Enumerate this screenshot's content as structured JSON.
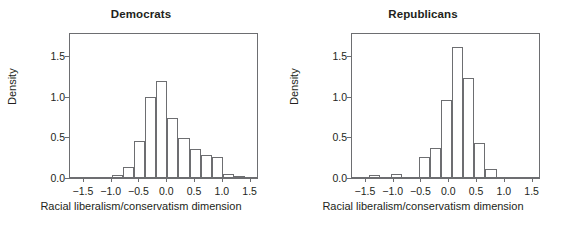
{
  "figure": {
    "background": "#ffffff",
    "line_color": "#6d6e71",
    "text_color": "#231f20"
  },
  "chart_data": [
    {
      "type": "bar",
      "title": "Democrats",
      "xlabel": "Racial liberalism/conservatism dimension",
      "ylabel": "Density",
      "xlim": [
        -1.75,
        1.65
      ],
      "ylim": [
        0,
        1.78
      ],
      "grid": false,
      "legend": null,
      "xticks": [
        -1.5,
        -1.0,
        -0.5,
        0.0,
        0.5,
        1.0,
        1.5
      ],
      "xticklabels": [
        "−1.5",
        "−1.0",
        "−0.5",
        "0.0",
        "0.5",
        "1.0",
        "1.5"
      ],
      "yticks": [
        0.0,
        0.5,
        1.0,
        1.5
      ],
      "yticklabels": [
        "0.0",
        "0.5",
        "1.0",
        "1.5"
      ],
      "bins": [
        {
          "x0": -1.0,
          "x1": -0.8,
          "value": 0.02
        },
        {
          "x0": -0.8,
          "x1": -0.6,
          "value": 0.12
        },
        {
          "x0": -0.6,
          "x1": -0.4,
          "value": 0.44
        },
        {
          "x0": -0.4,
          "x1": -0.2,
          "value": 0.98
        },
        {
          "x0": -0.2,
          "x1": 0.0,
          "value": 1.18
        },
        {
          "x0": 0.0,
          "x1": 0.2,
          "value": 0.73
        },
        {
          "x0": 0.2,
          "x1": 0.4,
          "value": 0.48
        },
        {
          "x0": 0.4,
          "x1": 0.6,
          "value": 0.34
        },
        {
          "x0": 0.6,
          "x1": 0.8,
          "value": 0.27
        },
        {
          "x0": 0.8,
          "x1": 1.0,
          "value": 0.24
        },
        {
          "x0": 1.0,
          "x1": 1.2,
          "value": 0.04
        },
        {
          "x0": 1.2,
          "x1": 1.4,
          "value": 0.015
        }
      ]
    },
    {
      "type": "bar",
      "title": "Republicans",
      "xlabel": "Racial liberalism/conservatism dimension",
      "ylabel": "Density",
      "xlim": [
        -1.75,
        1.65
      ],
      "ylim": [
        0,
        1.78
      ],
      "grid": false,
      "legend": null,
      "xticks": [
        -1.5,
        -1.0,
        -0.5,
        0.0,
        0.5,
        1.0,
        1.5
      ],
      "xticklabels": [
        "−1.5",
        "−1.0",
        "−0.5",
        "0.0",
        "0.5",
        "1.0",
        "1.5"
      ],
      "yticks": [
        0.0,
        0.5,
        1.0,
        1.5
      ],
      "yticklabels": [
        "0.0",
        "0.5",
        "1.0",
        "1.5"
      ],
      "bins": [
        {
          "x0": -1.45,
          "x1": -1.25,
          "value": 0.02
        },
        {
          "x0": -1.05,
          "x1": -0.85,
          "value": 0.04
        },
        {
          "x0": -0.55,
          "x1": -0.35,
          "value": 0.24
        },
        {
          "x0": -0.35,
          "x1": -0.15,
          "value": 0.36
        },
        {
          "x0": -0.15,
          "x1": 0.05,
          "value": 0.94
        },
        {
          "x0": 0.05,
          "x1": 0.25,
          "value": 1.59
        },
        {
          "x0": 0.25,
          "x1": 0.45,
          "value": 1.22
        },
        {
          "x0": 0.45,
          "x1": 0.65,
          "value": 0.42
        },
        {
          "x0": 0.65,
          "x1": 0.85,
          "value": 0.1
        }
      ]
    }
  ]
}
